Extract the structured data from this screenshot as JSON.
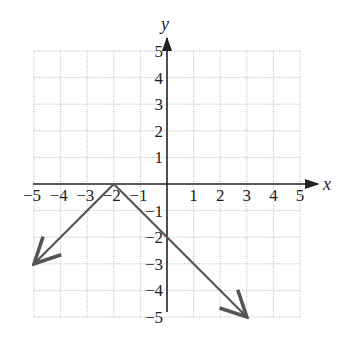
{
  "chart_data": {
    "type": "line",
    "title": "",
    "xlabel": "x",
    "ylabel": "y",
    "xlim": [
      -5,
      5
    ],
    "ylim": [
      -5,
      5
    ],
    "grid": true,
    "x_ticks": [
      -5,
      -4,
      -3,
      -2,
      -1,
      1,
      2,
      3,
      4,
      5
    ],
    "y_ticks": [
      5,
      4,
      3,
      2,
      1,
      -1,
      -2,
      -3,
      -4,
      -5
    ],
    "x_tick_labels": [
      "−5",
      "−4",
      "−3",
      "−2",
      "−1",
      "1",
      "2",
      "3",
      "4",
      "5"
    ],
    "y_tick_labels": [
      "5",
      "4",
      "3",
      "2",
      "1",
      "−1",
      "−2",
      "−3",
      "−4",
      "−5"
    ],
    "series": [
      {
        "name": "y = -|x + 2|",
        "x": [
          -5,
          -2,
          3
        ],
        "y": [
          -3,
          0,
          -5
        ],
        "arrows": "both ends",
        "color": "#555555"
      }
    ],
    "vertex": {
      "x": -2,
      "y": 0
    }
  },
  "axes": {
    "x_label": "x",
    "y_label": "y"
  }
}
